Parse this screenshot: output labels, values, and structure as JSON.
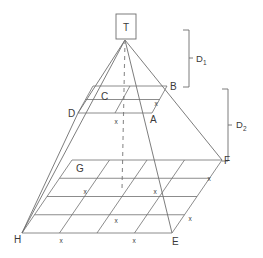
{
  "figure": {
    "title_box": {
      "label": "T",
      "name": "apex-box"
    },
    "vertex_labels": [
      {
        "id": "A",
        "text": "A",
        "x": 150,
        "y": 123
      },
      {
        "id": "B",
        "text": "B",
        "x": 170,
        "y": 90
      },
      {
        "id": "C",
        "text": "C",
        "x": 101,
        "y": 100
      },
      {
        "id": "D",
        "text": "D",
        "x": 68,
        "y": 117
      },
      {
        "id": "E",
        "text": "E",
        "x": 172,
        "y": 245
      },
      {
        "id": "F",
        "text": "F",
        "x": 224,
        "y": 164
      },
      {
        "id": "G",
        "text": "G",
        "x": 76,
        "y": 172
      },
      {
        "id": "H",
        "text": "H",
        "x": 14,
        "y": 243
      }
    ],
    "cell_marks": [
      {
        "text": "x",
        "x": 156,
        "y": 106
      },
      {
        "text": "x",
        "x": 116,
        "y": 124
      },
      {
        "text": "x",
        "x": 209,
        "y": 181
      },
      {
        "text": "x",
        "x": 155,
        "y": 194
      },
      {
        "text": "x",
        "x": 85,
        "y": 194
      },
      {
        "text": "x",
        "x": 190,
        "y": 221
      },
      {
        "text": "x",
        "x": 116,
        "y": 223
      },
      {
        "text": "x",
        "x": 61,
        "y": 243
      },
      {
        "text": "x",
        "x": 134,
        "y": 243
      }
    ],
    "dimension_brackets": [
      {
        "label": "D",
        "subscript": "1",
        "name": "dimension-bracket-d1",
        "x": 189,
        "y_top": 30,
        "y_bottom": 87,
        "label_x": 196,
        "label_y": 62
      },
      {
        "label": "D",
        "subscript": "2",
        "name": "dimension-bracket-d2",
        "x": 228,
        "y_top": 89,
        "y_bottom": 161,
        "label_x": 236,
        "label_y": 128
      }
    ],
    "colors": {
      "stroke": "#6e6e6e",
      "label": "#3a3a3a",
      "background": "#ffffff"
    },
    "apex": {
      "x": 125,
      "y": 40
    }
  }
}
